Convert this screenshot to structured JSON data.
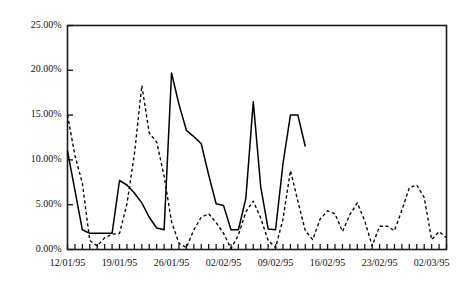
{
  "chart_data": {
    "type": "line",
    "title": "",
    "xlabel": "",
    "ylabel": "",
    "ylim": [
      0,
      25
    ],
    "ytick_values": [
      0,
      5,
      10,
      15,
      20,
      25
    ],
    "ytick_labels": [
      "0.00%",
      "5.00%",
      "10.00%",
      "15.00%",
      "20.00%",
      "25.00%"
    ],
    "grid": false,
    "legend": "none",
    "x_start_date": "12/01/95",
    "x_end_date": "02/03/95",
    "x_tick_interval": "daily",
    "xtick_labels": [
      "12/01/95",
      "19/01/95",
      "26/01/95",
      "02/02/95",
      "09/02/95",
      "16/02/95",
      "23/02/95",
      "02/03/95"
    ],
    "xtick_label_indices": [
      0,
      7,
      14,
      21,
      28,
      35,
      42,
      49
    ],
    "n_points": 52,
    "series": [
      {
        "name": "solid-series",
        "style": "solid",
        "color": "#000000",
        "values": [
          11.0,
          6.6,
          2.2,
          1.8,
          1.8,
          1.8,
          1.8,
          7.7,
          7.2,
          6.3,
          5.2,
          3.6,
          2.4,
          2.2,
          19.7,
          16.2,
          13.3,
          12.6,
          11.8,
          8.3,
          5.1,
          4.9,
          2.2,
          2.2,
          5.7,
          16.5,
          7.0,
          2.3,
          2.2,
          9.6,
          15.0,
          15.0,
          11.5,
          null,
          null,
          null,
          null,
          null,
          null,
          null,
          null,
          null,
          null,
          null,
          null,
          null,
          null,
          null,
          null,
          null,
          null,
          null
        ]
      },
      {
        "name": "dashed-series",
        "style": "dashed",
        "color": "#000000",
        "values": [
          15.0,
          10.5,
          7.4,
          1.0,
          0.4,
          1.3,
          1.7,
          1.8,
          5.1,
          10.6,
          18.3,
          13.0,
          12.0,
          8.2,
          3.1,
          0.7,
          0.2,
          2.2,
          3.6,
          4.0,
          3.0,
          1.8,
          0.1,
          1.6,
          4.2,
          5.4,
          3.5,
          1.0,
          0.2,
          3.4,
          8.8,
          5.4,
          2.1,
          1.1,
          3.4,
          4.3,
          4.0,
          2.0,
          3.9,
          5.2,
          3.2,
          0.4,
          2.6,
          2.6,
          2.1,
          4.4,
          6.9,
          7.2,
          5.8,
          1.1,
          2.0,
          1.3
        ]
      }
    ]
  },
  "axes": {
    "frame_color": "#1a1a1a",
    "tick_color": "#1a1a1a"
  }
}
